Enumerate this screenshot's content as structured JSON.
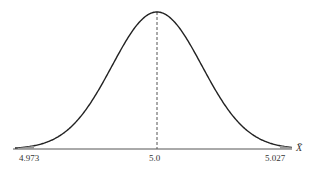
{
  "chart_data": {
    "type": "line",
    "title": "",
    "xlabel": "X̄",
    "ylabel": "",
    "distribution": "normal",
    "mean": 5.0,
    "x_ticks": [
      4.973,
      5.0,
      5.027
    ],
    "tick_labels": [
      "4.973",
      "5.0",
      "5.027"
    ],
    "annotations": [
      "dashed vertical line at mean 5.0",
      "shaded tails beyond 4.973 and 5.027"
    ],
    "grid": false,
    "legend": false
  },
  "labels": {
    "left": "4.973",
    "center": "5.0",
    "right": "5.027",
    "axis": "X̄"
  }
}
